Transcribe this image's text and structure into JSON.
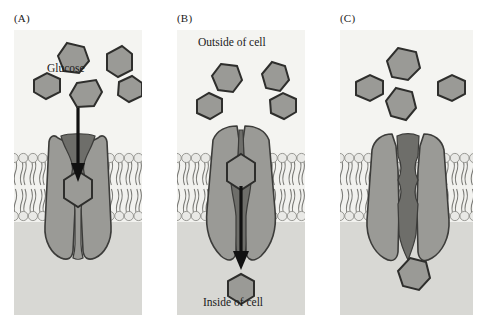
{
  "figure": {
    "type": "diagram",
    "panel_count": 3
  },
  "labels": {
    "panel_a": "(A)",
    "panel_b": "(B)",
    "panel_c": "(C)",
    "glucose": "Glucose",
    "outside_of_cell": "Outside of cell",
    "inside_of_cell": "Inside of cell"
  },
  "colors": {
    "page_background": "#ffffff",
    "panel_background": "#f2f2ef",
    "extracellular_background": "#f4f4f1",
    "cytoplasm_background": "#d8d8d4",
    "protein_fill": "#9a9a96",
    "protein_outline": "#3c3c3a",
    "channel_fill": "#6e6e6a",
    "glucose_fill": "#9a9a96",
    "glucose_outline": "#2e2e2c",
    "lipid_head_fill": "#e9e9e6",
    "lipid_head_outline": "#8e8e8a",
    "lipid_tail": "#7a7a76",
    "arrow": "#111111",
    "text": "#1a1a1a"
  },
  "geometry": {
    "image_width": 488,
    "image_height": 325,
    "panel_top": 30,
    "panel_height": 285,
    "membrane_top": 152,
    "membrane_bottom": 222
  },
  "panels": [
    {
      "id": "A",
      "label": "(A)",
      "caption_text": "Glucose",
      "state": "open to outside of cell",
      "channel_open_side": "outside",
      "arrow": {
        "present": true,
        "direction": "down",
        "from": "extracellular",
        "to": "channel"
      },
      "glucose_outside_count": 4,
      "glucose_in_channel": 1,
      "glucose_inside_count": 0
    },
    {
      "id": "B",
      "label": "(B)",
      "caption_top": "Outside of cell",
      "caption_bottom": "Inside of cell",
      "state": "open to inside of cell",
      "channel_open_side": "inside",
      "arrow": {
        "present": true,
        "direction": "down",
        "from": "channel",
        "to": "cytoplasm"
      },
      "glucose_outside_count": 4,
      "glucose_in_channel": 1,
      "glucose_inside_count": 1
    },
    {
      "id": "C",
      "label": "(C)",
      "state": "closed / reset, glucose released into cell",
      "channel_open_side": "outside",
      "arrow": {
        "present": false
      },
      "glucose_outside_count": 4,
      "glucose_in_channel": 0,
      "glucose_inside_count": 1
    }
  ]
}
